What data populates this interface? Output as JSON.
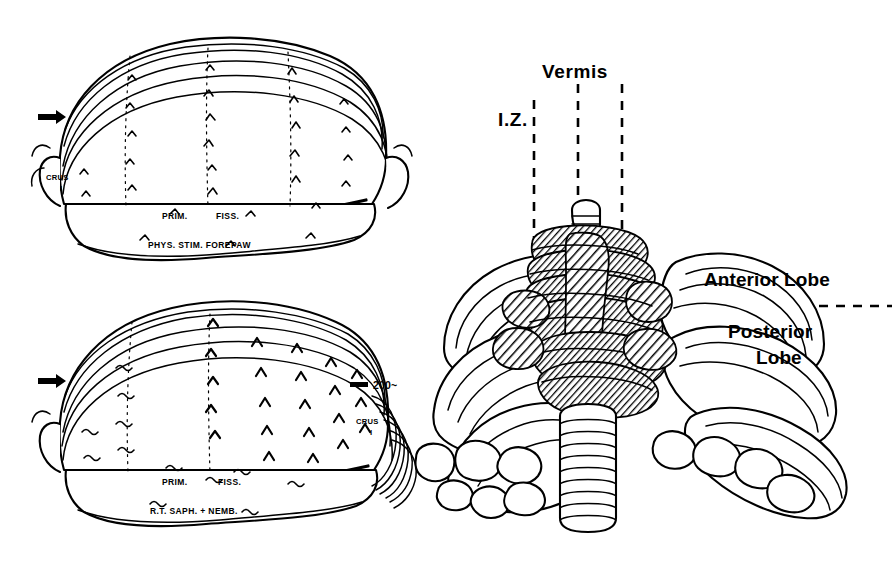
{
  "figure": {
    "kind": "cerebellar-cortex-somatotopic-map",
    "background_color": "#ffffff",
    "ink_color": "#000000",
    "width": 896,
    "height": 562
  },
  "panels": {
    "top_left": {
      "name": "physiological-stimulation-map",
      "caption": "PHYS. STIM. FOREPAW",
      "fissure_label": "PRIM.",
      "fissure_label_2": "FISS.",
      "crus_label_line1": "CRUS",
      "crus_label_line2": "I",
      "arrow_marker": "→"
    },
    "bottom_left": {
      "name": "saphenous-nerve-stimulation-map",
      "caption": "R.T. SAPH. + NEMB.",
      "fissure_label": "PRIM.",
      "fissure_label_2": "FISS.",
      "crus_label_line1": "CRUS",
      "crus_label_line2": "I",
      "arrow_marker": "→",
      "scale_bar_label": "200~"
    },
    "right": {
      "name": "unfolded-cerebellum-overview",
      "zone_label_iz": "I.Z.",
      "zone_label_vermis": "Vermis",
      "lobe_label_anterior": "Anterior Lobe",
      "lobe_label_posterior_line1": "Posterior",
      "lobe_label_posterior_line2": "Lobe"
    }
  }
}
